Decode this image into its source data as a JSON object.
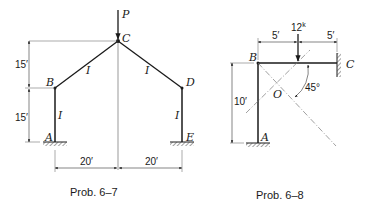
{
  "prob_6_7": {
    "caption": "Prob. 6–7",
    "load_label": "P",
    "nodes": {
      "A": "A",
      "B": "B",
      "C": "C",
      "D": "D",
      "E": "E"
    },
    "member_labels": [
      "I",
      "I",
      "I",
      "I"
    ],
    "dims": {
      "upper_height": "15′",
      "lower_height": "15′",
      "left_span": "20′",
      "right_span": "20′"
    }
  },
  "prob_6_8": {
    "caption": "Prob. 6–8",
    "load_label": "12",
    "load_unit": "k",
    "nodes": {
      "A": "A",
      "B": "B",
      "C": "C",
      "O": "O"
    },
    "angle_label": "45°",
    "dims": {
      "left_span": "5′",
      "right_span": "5′",
      "height": "10′"
    }
  }
}
